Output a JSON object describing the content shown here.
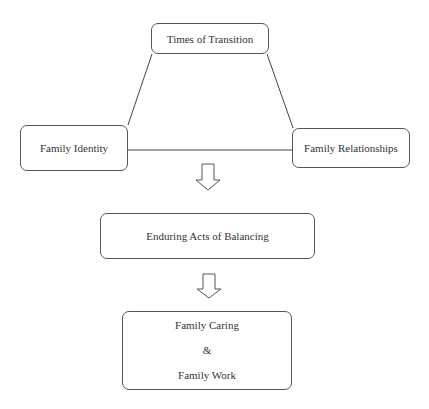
{
  "diagram": {
    "title": "Times of Transition",
    "left_node": "Family Identity",
    "right_node": "Family Relationships",
    "middle_node": "Enduring Acts of Balancing",
    "bottom_node": {
      "line1": "Family Caring",
      "line2": "&",
      "line3": "Family Work"
    },
    "arrows": [
      "down-arrow",
      "down-arrow"
    ]
  }
}
